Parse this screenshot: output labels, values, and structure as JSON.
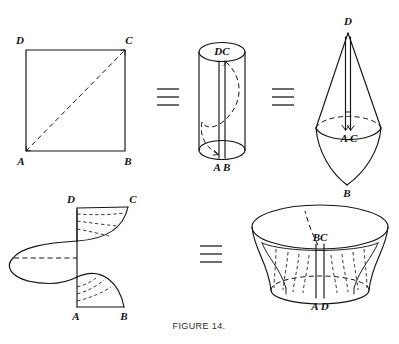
{
  "figure": {
    "caption": "FIGURE 14.",
    "panels": [
      {
        "id": "square",
        "name": "square-with-diagonal",
        "vertices": {
          "top_left": "D",
          "top_right": "C",
          "bottom_left": "A",
          "bottom_right": "B"
        },
        "diagonal": "A-C"
      },
      {
        "id": "cylinder",
        "name": "cylinder",
        "labels": {
          "top": "DC",
          "bottom": "A B"
        }
      },
      {
        "id": "cone",
        "name": "double-cone",
        "labels": {
          "apex": "D",
          "middle": "A C",
          "bottom": "B"
        }
      },
      {
        "id": "helicoid",
        "name": "twisted-strip",
        "vertices": {
          "top_left": "D",
          "top_right": "C",
          "bottom_left": "A",
          "bottom_right": "B"
        }
      },
      {
        "id": "funnel",
        "name": "hyperboloid-funnel",
        "labels": {
          "top": "BC",
          "bottom": "A D"
        }
      }
    ],
    "equivalence_symbol": "≡",
    "equivalence_count": 3,
    "colors": {
      "ink": "#141414",
      "background": "#ffffff",
      "caption": "#2a2a2a"
    }
  }
}
